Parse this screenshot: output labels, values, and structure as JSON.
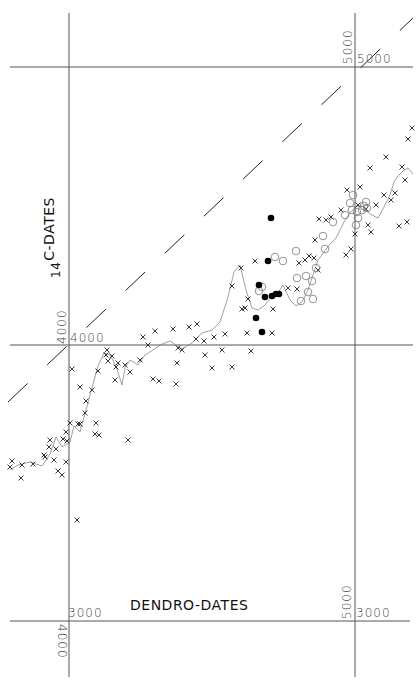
{
  "chart_data": {
    "type": "scatter",
    "title": "",
    "xlabel": "DENDRO-DATES",
    "ylabel_prefix": "14",
    "ylabel": "C-DATES",
    "ylabel_full": "14C-DATES",
    "axes_note": "Two overlapping reference frames; dendro-dates on x, 14C-dates on y (age increasing right/up).",
    "tick_labels": {
      "top_right_vertical": "5000",
      "top_right_horizontal": "5000",
      "mid_left_vertical": "4000",
      "mid_left_horizontal": "4000",
      "bottom_left_horizontal": "3000",
      "bottom_left_vertical": "4000",
      "bottom_right_vertical": "5000",
      "bottom_right_horizontal": "3000"
    },
    "grid": {
      "vertical_lines_x": [
        69,
        355
      ],
      "horizontal_lines_y": [
        67,
        345,
        621
      ]
    },
    "reference_line": {
      "name": "1:1 line (dashed)",
      "style": "dashed",
      "from": [
        8,
        402
      ],
      "to": [
        413,
        18
      ]
    },
    "series": [
      {
        "name": "calibration points (x)",
        "marker": "x",
        "points": [
          [
            12,
            461
          ],
          [
            10,
            467
          ],
          [
            21,
            478
          ],
          [
            22,
            465
          ],
          [
            33,
            464
          ],
          [
            45,
            457
          ],
          [
            44,
            455
          ],
          [
            54,
            460
          ],
          [
            49,
            447
          ],
          [
            50,
            440
          ],
          [
            56,
            449
          ],
          [
            63,
            439
          ],
          [
            58,
            471
          ],
          [
            62,
            475
          ],
          [
            66,
            462
          ],
          [
            67,
            441
          ],
          [
            66,
            432
          ],
          [
            70,
            423
          ],
          [
            77,
            520
          ],
          [
            78,
            424
          ],
          [
            80,
            424
          ],
          [
            85,
            413
          ],
          [
            86,
            401
          ],
          [
            96,
            423
          ],
          [
            95,
            434
          ],
          [
            99,
            435
          ],
          [
            98,
            371
          ],
          [
            107,
            350
          ],
          [
            106,
            355
          ],
          [
            108,
            361
          ],
          [
            112,
            356
          ],
          [
            118,
            363
          ],
          [
            116,
            367
          ],
          [
            128,
            440
          ],
          [
            72,
            369
          ],
          [
            80,
            387
          ],
          [
            92,
            390
          ],
          [
            115,
            380
          ],
          [
            125,
            365
          ],
          [
            130,
            372
          ],
          [
            140,
            360
          ],
          [
            153,
            379
          ],
          [
            143,
            337
          ],
          [
            159,
            381
          ],
          [
            176,
            384
          ],
          [
            155,
            331
          ],
          [
            173,
            329
          ],
          [
            148,
            345
          ],
          [
            178,
            348
          ],
          [
            182,
            350
          ],
          [
            189,
            327
          ],
          [
            196,
            339
          ],
          [
            197,
            324
          ],
          [
            204,
            341
          ],
          [
            177,
            363
          ],
          [
            205,
            355
          ],
          [
            212,
            368
          ],
          [
            214,
            337
          ],
          [
            222,
            350
          ],
          [
            225,
            334
          ],
          [
            232,
            367
          ],
          [
            242,
            309
          ],
          [
            248,
            299
          ],
          [
            232,
            286
          ],
          [
            241,
            268
          ],
          [
            245,
            308
          ],
          [
            251,
            351
          ],
          [
            247,
            333
          ],
          [
            255,
            261
          ],
          [
            272,
            333
          ],
          [
            273,
            309
          ],
          [
            288,
            288
          ],
          [
            297,
            289
          ],
          [
            299,
            263
          ],
          [
            309,
            256
          ],
          [
            305,
            260
          ],
          [
            314,
            258
          ],
          [
            318,
            270
          ],
          [
            315,
            240
          ],
          [
            319,
            219
          ],
          [
            326,
            220
          ],
          [
            331,
            217
          ],
          [
            341,
            210
          ],
          [
            347,
            190
          ],
          [
            346,
            255
          ],
          [
            351,
            249
          ],
          [
            355,
            234
          ],
          [
            360,
            187
          ],
          [
            370,
            168
          ],
          [
            386,
            157
          ],
          [
            391,
            200
          ],
          [
            408,
            139
          ],
          [
            412,
            128
          ],
          [
            402,
            167
          ],
          [
            405,
            180
          ],
          [
            395,
            193
          ],
          [
            407,
            222
          ],
          [
            399,
            226
          ],
          [
            384,
            195
          ],
          [
            376,
            205
          ],
          [
            366,
            209
          ],
          [
            371,
            232
          ],
          [
            358,
            205
          ],
          [
            368,
            225
          ]
        ]
      },
      {
        "name": "open circles",
        "marker": "circle-open",
        "points": [
          [
            275,
            257
          ],
          [
            283,
            261
          ],
          [
            296,
            251
          ],
          [
            297,
            278
          ],
          [
            306,
            276
          ],
          [
            316,
            268
          ],
          [
            308,
            292
          ],
          [
            312,
            281
          ],
          [
            325,
            249
          ],
          [
            323,
            236
          ],
          [
            333,
            222
          ],
          [
            345,
            215
          ],
          [
            350,
            203
          ],
          [
            352,
            210
          ],
          [
            353,
            195
          ],
          [
            357,
            212
          ],
          [
            358,
            218
          ],
          [
            356,
            225
          ],
          [
            362,
            210
          ],
          [
            364,
            206
          ],
          [
            366,
            202
          ],
          [
            367,
            208
          ],
          [
            301,
            301
          ],
          [
            313,
            299
          ],
          [
            259,
            291
          ],
          [
            262,
            287
          ]
        ]
      },
      {
        "name": "filled dots",
        "marker": "circle-filled",
        "points": [
          [
            271,
            218
          ],
          [
            268,
            261
          ],
          [
            259,
            285
          ],
          [
            265,
            297
          ],
          [
            272,
            296
          ],
          [
            276,
            294
          ],
          [
            279,
            294
          ],
          [
            256,
            318
          ],
          [
            262,
            332
          ]
        ]
      }
    ],
    "curve": {
      "name": "smoothed calibration curve",
      "style": "thin line",
      "points": [
        [
          10,
          470
        ],
        [
          18,
          465
        ],
        [
          30,
          462
        ],
        [
          42,
          466
        ],
        [
          50,
          454
        ],
        [
          56,
          437
        ],
        [
          62,
          447
        ],
        [
          70,
          442
        ],
        [
          74,
          426
        ],
        [
          80,
          432
        ],
        [
          86,
          410
        ],
        [
          92,
          388
        ],
        [
          98,
          366
        ],
        [
          104,
          353
        ],
        [
          110,
          355
        ],
        [
          116,
          366
        ],
        [
          122,
          385
        ],
        [
          125,
          368
        ],
        [
          130,
          360
        ],
        [
          138,
          365
        ],
        [
          145,
          355
        ],
        [
          153,
          350
        ],
        [
          160,
          345
        ],
        [
          170,
          341
        ],
        [
          182,
          349
        ],
        [
          192,
          343
        ],
        [
          202,
          333
        ],
        [
          212,
          330
        ],
        [
          220,
          322
        ],
        [
          228,
          297
        ],
        [
          234,
          272
        ],
        [
          240,
          265
        ],
        [
          246,
          290
        ],
        [
          252,
          308
        ],
        [
          258,
          310
        ],
        [
          264,
          306
        ],
        [
          270,
          299
        ],
        [
          274,
          297
        ],
        [
          278,
          293
        ],
        [
          283,
          285
        ],
        [
          290,
          300
        ],
        [
          296,
          306
        ],
        [
          302,
          302
        ],
        [
          308,
          290
        ],
        [
          314,
          272
        ],
        [
          318,
          260
        ],
        [
          324,
          252
        ],
        [
          330,
          244
        ],
        [
          336,
          238
        ],
        [
          340,
          230
        ],
        [
          344,
          222
        ],
        [
          350,
          213
        ],
        [
          356,
          206
        ],
        [
          362,
          206
        ],
        [
          370,
          214
        ],
        [
          378,
          218
        ],
        [
          384,
          207
        ],
        [
          390,
          195
        ],
        [
          394,
          182
        ],
        [
          398,
          176
        ],
        [
          404,
          170
        ],
        [
          408,
          168
        ],
        [
          413,
          174
        ]
      ]
    }
  }
}
